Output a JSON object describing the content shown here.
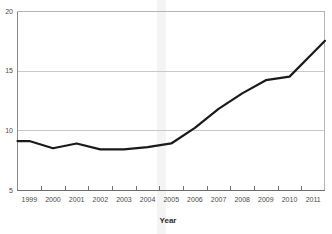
{
  "chart_data": {
    "type": "line",
    "title": "",
    "subtitle": "",
    "xlabel": "Year",
    "ylabel": "",
    "grid": true,
    "legend": null,
    "legend_position": "none",
    "xlim": [
      1998.5,
      2011.5
    ],
    "ylim": [
      5,
      20
    ],
    "ytick_labels": [
      "20",
      "15",
      "10",
      "5"
    ],
    "ytick_values": [
      20,
      15,
      10,
      5
    ],
    "categories": [
      "1999",
      "2000",
      "2001",
      "2002",
      "2003",
      "2004",
      "2005",
      "2006",
      "2007",
      "2008",
      "2009",
      "2010",
      "2011"
    ],
    "x": [
      1999,
      2000,
      2001,
      2002,
      2003,
      2004,
      2005,
      2006,
      2007,
      2008,
      2009,
      2010,
      2011
    ],
    "values": [
      9.1,
      8.5,
      8.9,
      8.4,
      8.4,
      8.6,
      8.9,
      10.2,
      11.8,
      13.1,
      14.2,
      14.5,
      16.5
    ],
    "series": [
      {
        "name": "value",
        "color": "#1a1a1a",
        "line_width": 2.2,
        "values": [
          9.1,
          8.5,
          8.9,
          8.4,
          8.4,
          8.6,
          8.9,
          10.2,
          11.8,
          13.1,
          14.2,
          14.5,
          16.5
        ]
      }
    ],
    "annotations": []
  },
  "axes": {
    "x_title": "Year",
    "y_ticks": [
      {
        "label": "20",
        "value": 20
      },
      {
        "label": "15",
        "value": 15
      },
      {
        "label": "10",
        "value": 10
      },
      {
        "label": "5",
        "value": 5
      }
    ],
    "x_ticks": [
      {
        "label": "1999"
      },
      {
        "label": "2000"
      },
      {
        "label": "2001"
      },
      {
        "label": "2002"
      },
      {
        "label": "2003"
      },
      {
        "label": "2004"
      },
      {
        "label": "2005"
      },
      {
        "label": "2006"
      },
      {
        "label": "2007"
      },
      {
        "label": "2008"
      },
      {
        "label": "2009"
      },
      {
        "label": "2010"
      },
      {
        "label": "2011"
      }
    ]
  },
  "colors": {
    "line": "#1a1a1a",
    "grid": "#c8c8c8",
    "axis": "#8a8a8a",
    "tick_text": "#4a4a4a",
    "title_text": "#2b2b2b",
    "background": "#ffffff",
    "scan_band": "#f2f2f2"
  }
}
